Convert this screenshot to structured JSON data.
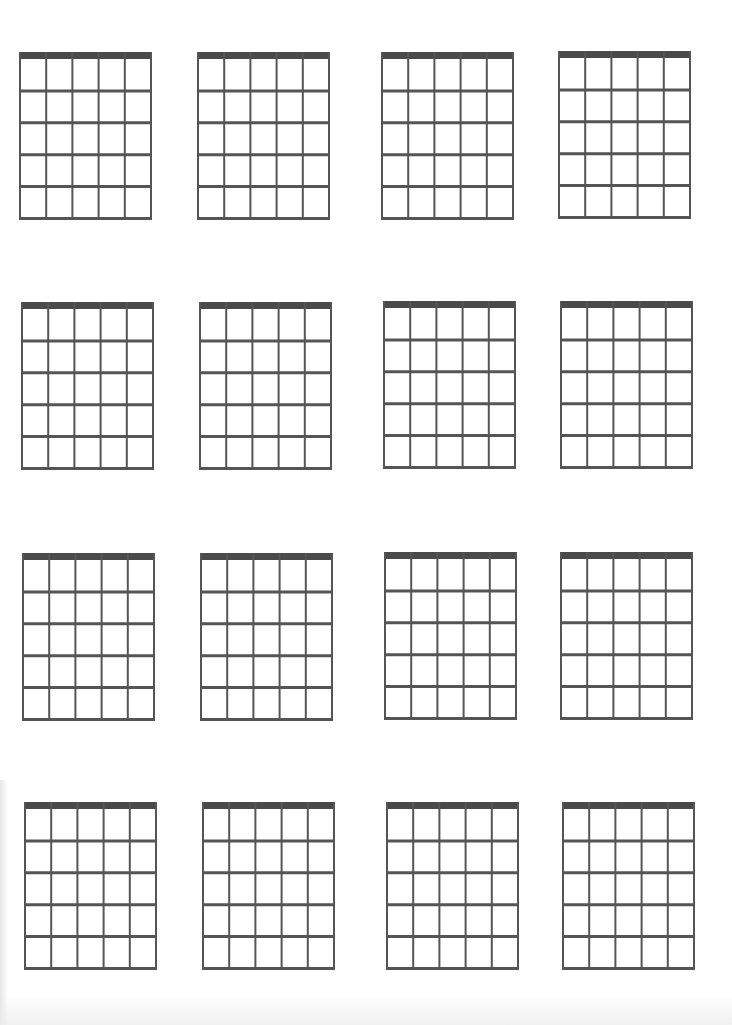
{
  "sheet": {
    "type": "blank-guitar-chord-diagram-sheet",
    "rows": 4,
    "columns": 4,
    "strings_per_diagram": 6,
    "frets_per_diagram": 5,
    "colors": {
      "background": "#ffffff",
      "nut": "#4a4a4a",
      "lines": "#555555"
    },
    "diagrams": [
      {
        "row": 1,
        "col": 1,
        "x": 19,
        "y": 52
      },
      {
        "row": 1,
        "col": 2,
        "x": 197,
        "y": 52
      },
      {
        "row": 1,
        "col": 3,
        "x": 381,
        "y": 52
      },
      {
        "row": 1,
        "col": 4,
        "x": 558,
        "y": 51
      },
      {
        "row": 2,
        "col": 1,
        "x": 21,
        "y": 302
      },
      {
        "row": 2,
        "col": 2,
        "x": 199,
        "y": 302
      },
      {
        "row": 2,
        "col": 3,
        "x": 383,
        "y": 301
      },
      {
        "row": 2,
        "col": 4,
        "x": 560,
        "y": 301
      },
      {
        "row": 3,
        "col": 1,
        "x": 22,
        "y": 553
      },
      {
        "row": 3,
        "col": 2,
        "x": 200,
        "y": 553
      },
      {
        "row": 3,
        "col": 3,
        "x": 384,
        "y": 552
      },
      {
        "row": 3,
        "col": 4,
        "x": 560,
        "y": 552
      },
      {
        "row": 4,
        "col": 1,
        "x": 24,
        "y": 802
      },
      {
        "row": 4,
        "col": 2,
        "x": 202,
        "y": 802
      },
      {
        "row": 4,
        "col": 3,
        "x": 386,
        "y": 802
      },
      {
        "row": 4,
        "col": 4,
        "x": 562,
        "y": 802
      }
    ]
  }
}
